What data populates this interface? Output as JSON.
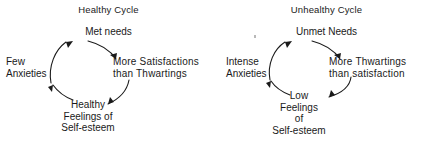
{
  "figure": {
    "background_color": "#ffffff",
    "ink_color": "#1a1a1a"
  },
  "cycles": [
    {
      "id": "healthy-cycle",
      "title": "Healthy Cycle",
      "nodes": {
        "top": {
          "lines": [
            "Met needs"
          ]
        },
        "left": {
          "lines": [
            "Few",
            "Anxieties"
          ]
        },
        "right": {
          "lines": [
            "More  Satisfactions",
            "than  Thwartings"
          ]
        },
        "bottom": {
          "lines": [
            "Healthy",
            "Feelings of",
            "Self-esteem"
          ]
        }
      },
      "arrows": [
        {
          "from": "left",
          "to": "top",
          "direction": "up-right"
        },
        {
          "from": "top",
          "to": "right",
          "direction": "down-right"
        },
        {
          "from": "right",
          "to": "bottom",
          "direction": "down-left"
        },
        {
          "from": "bottom",
          "to": "left",
          "direction": "up-left"
        }
      ]
    },
    {
      "id": "unhealthy-cycle",
      "title": "Unhealthy Cycle",
      "nodes": {
        "top": {
          "lines": [
            "Unmet Needs"
          ]
        },
        "left": {
          "lines": [
            "Intense",
            "Anxieties"
          ]
        },
        "right": {
          "lines": [
            "More Thwartings",
            "than  satisfaction"
          ]
        },
        "bottom": {
          "lines": [
            "Low",
            "Feelings",
            "of",
            "Self-esteem"
          ]
        }
      },
      "arrows": [
        {
          "from": "left",
          "to": "top",
          "direction": "up-right"
        },
        {
          "from": "top",
          "to": "right",
          "direction": "down-right"
        },
        {
          "from": "right",
          "to": "bottom",
          "direction": "down-left"
        },
        {
          "from": "bottom",
          "to": "left",
          "direction": "up-left"
        }
      ]
    }
  ]
}
